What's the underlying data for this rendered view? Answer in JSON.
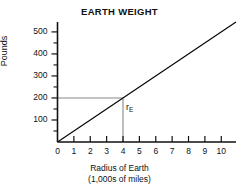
{
  "chart_data": {
    "type": "line",
    "title": "EARTH WEIGHT",
    "xlabel_line1": "Radius of Earth",
    "xlabel_line2": "(1,000s of miles)",
    "ylabel": "Pounds",
    "xlim": [
      0,
      10.9
    ],
    "ylim": [
      0,
      545
    ],
    "xticks": [
      0,
      1,
      2,
      3,
      4,
      5,
      6,
      7,
      8,
      9,
      10
    ],
    "xtick_labels": [
      "0",
      "1",
      "2",
      "3",
      "4",
      "5",
      "6",
      "7",
      "8",
      "9",
      "10"
    ],
    "yticks": [
      100,
      200,
      300,
      400,
      500
    ],
    "ytick_labels": [
      "100",
      "200",
      "300",
      "400",
      "500"
    ],
    "yticks_minor": [
      50,
      150,
      250,
      350,
      450
    ],
    "grid": false,
    "legend": "none",
    "series": [
      {
        "name": "Weight vs radius",
        "color": "#000000",
        "points": [
          [
            0,
            0
          ],
          [
            10.9,
            545
          ]
        ],
        "slope_pounds_per_1000_miles": 50
      }
    ],
    "annotations": [
      {
        "name": "earth-radius-marker",
        "text": "r",
        "subscript": "E",
        "x": 4,
        "y": 200,
        "color": "#111111"
      }
    ],
    "reference_lines": [
      {
        "name": "horizontal-200-pounds",
        "orientation": "horizontal",
        "value": 200,
        "from_x": 0,
        "to_x": 4,
        "color": "#888888"
      },
      {
        "name": "vertical-radius-4",
        "orientation": "vertical",
        "value": 4,
        "from_y": 0,
        "to_y": 200,
        "color": "#888888"
      }
    ]
  }
}
